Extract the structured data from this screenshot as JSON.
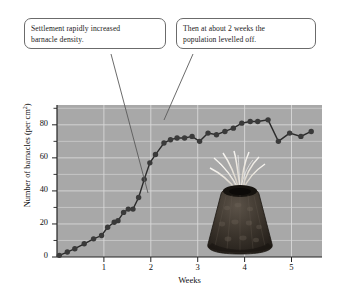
{
  "figure": {
    "alt_name": "barnacle-density-over-time-figure"
  },
  "callouts": [
    {
      "name": "callout-settlement",
      "line1": "Settlement rapidly increased",
      "line2": "barnacle density."
    },
    {
      "name": "callout-levelled-off",
      "line1": "Then at about 2 weeks the",
      "line2": "population levelled off."
    }
  ],
  "illustration": {
    "name": "barnacle-photo",
    "label": "barnacle-photograph"
  },
  "chart_data": {
    "type": "line",
    "title": "",
    "xlabel": "Weeks",
    "ylabel": "Number of barnacles (per cm²)",
    "ylabel_text": "Number of barnacles (per cm",
    "ylabel_sup": "2",
    "ylabel_tail": ")",
    "xlim": [
      0,
      5.65
    ],
    "ylim": [
      0,
      92
    ],
    "xticks": [
      1,
      2,
      3,
      4,
      5
    ],
    "xtick_labels": [
      "1",
      "2",
      "3",
      "4",
      "5"
    ],
    "yticks": [
      0,
      20,
      40,
      60,
      80
    ],
    "ytick_labels": [
      "0",
      "20",
      "40",
      "60",
      "80"
    ],
    "yminor_ticks": [
      10,
      30,
      50,
      70,
      90
    ],
    "grid": true,
    "grid_color": "#d8d8d8",
    "plot_background": "#a8a8a8",
    "marker_color": "#3a3a3a",
    "line_color": "#2e2e2e",
    "legend": "none",
    "series": [
      {
        "name": "Barnacle density",
        "x": [
          0.05,
          0.22,
          0.38,
          0.58,
          0.78,
          0.95,
          1.08,
          1.22,
          1.3,
          1.42,
          1.52,
          1.62,
          1.74,
          1.86,
          1.98,
          2.1,
          2.28,
          2.42,
          2.56,
          2.72,
          2.88,
          3.04,
          3.22,
          3.4,
          3.58,
          3.76,
          3.94,
          4.12,
          4.28,
          4.5,
          4.72,
          4.96,
          5.2,
          5.42
        ],
        "y": [
          1,
          3,
          5,
          8,
          11,
          13,
          18,
          21,
          22,
          27,
          29,
          29,
          36,
          47,
          57,
          62,
          69,
          71,
          72,
          72,
          73,
          70,
          75,
          74,
          76,
          78,
          81,
          82,
          82,
          83,
          70,
          75,
          73,
          76
        ]
      }
    ]
  }
}
